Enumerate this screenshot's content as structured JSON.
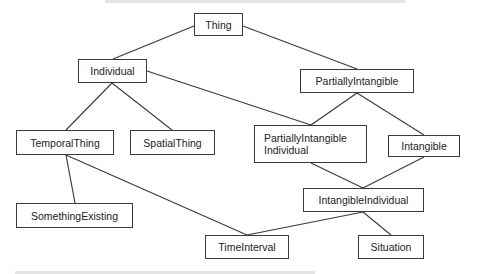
{
  "diagram": {
    "type": "class-hierarchy",
    "nodes": [
      {
        "id": "thing",
        "label": "Thing",
        "x": 194,
        "y": 13,
        "w": 49,
        "h": 23
      },
      {
        "id": "individual",
        "label": "Individual",
        "x": 78,
        "y": 59,
        "w": 69,
        "h": 24
      },
      {
        "id": "partially-intangible",
        "label": "PartiallyIntangible",
        "x": 300,
        "y": 69,
        "w": 114,
        "h": 24
      },
      {
        "id": "temporal-thing",
        "label": "TemporalThing",
        "x": 16,
        "y": 130,
        "w": 98,
        "h": 25
      },
      {
        "id": "spatial-thing",
        "label": "SpatialThing",
        "x": 130,
        "y": 130,
        "w": 85,
        "h": 25
      },
      {
        "id": "partially-intangible-individual",
        "label": "PartiallyIntangible\nIndividual",
        "line1": "PartiallyIntangible",
        "line2": "Individual",
        "x": 254,
        "y": 125,
        "w": 113,
        "h": 38
      },
      {
        "id": "intangible",
        "label": "Intangible",
        "x": 388,
        "y": 135,
        "w": 72,
        "h": 22
      },
      {
        "id": "intangible-individual",
        "label": "IntangibleIndividual",
        "x": 303,
        "y": 188,
        "w": 121,
        "h": 24
      },
      {
        "id": "something-existing",
        "label": "SomethingExisting",
        "x": 16,
        "y": 203,
        "w": 117,
        "h": 25
      },
      {
        "id": "time-interval",
        "label": "TimeInterval",
        "x": 205,
        "y": 235,
        "w": 84,
        "h": 24
      },
      {
        "id": "situation",
        "label": "Situation",
        "x": 358,
        "y": 235,
        "w": 66,
        "h": 24
      }
    ],
    "edges": [
      {
        "from": "thing",
        "to": "individual",
        "x1": 194,
        "y1": 26,
        "x2": 113,
        "y2": 59
      },
      {
        "from": "thing",
        "to": "partially-intangible",
        "x1": 243,
        "y1": 26,
        "x2": 357,
        "y2": 69
      },
      {
        "from": "individual",
        "to": "temporal-thing",
        "x1": 112,
        "y1": 83,
        "x2": 66,
        "y2": 130
      },
      {
        "from": "individual",
        "to": "spatial-thing",
        "x1": 112,
        "y1": 83,
        "x2": 172,
        "y2": 130
      },
      {
        "from": "individual",
        "to": "partially-intangible-individual",
        "x1": 147,
        "y1": 71,
        "x2": 311,
        "y2": 125
      },
      {
        "from": "partially-intangible",
        "to": "partially-intangible-individual",
        "x1": 357,
        "y1": 93,
        "x2": 311,
        "y2": 125
      },
      {
        "from": "partially-intangible",
        "to": "intangible",
        "x1": 357,
        "y1": 93,
        "x2": 424,
        "y2": 135
      },
      {
        "from": "partially-intangible-individual",
        "to": "intangible-individual",
        "x1": 311,
        "y1": 163,
        "x2": 363,
        "y2": 188
      },
      {
        "from": "intangible",
        "to": "intangible-individual",
        "x1": 424,
        "y1": 157,
        "x2": 363,
        "y2": 188
      },
      {
        "from": "temporal-thing",
        "to": "something-existing",
        "x1": 66,
        "y1": 155,
        "x2": 75,
        "y2": 203
      },
      {
        "from": "temporal-thing",
        "to": "time-interval",
        "x1": 66,
        "y1": 155,
        "x2": 247,
        "y2": 235
      },
      {
        "from": "intangible-individual",
        "to": "time-interval",
        "x1": 363,
        "y1": 212,
        "x2": 247,
        "y2": 235
      },
      {
        "from": "intangible-individual",
        "to": "situation",
        "x1": 363,
        "y1": 212,
        "x2": 391,
        "y2": 235
      }
    ],
    "colors": {
      "stroke": "#3a3a3a",
      "text": "#222222",
      "background": "#ffffff"
    }
  }
}
